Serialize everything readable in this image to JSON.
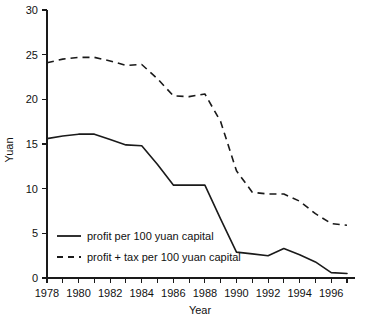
{
  "chart_data": {
    "type": "line",
    "title": "",
    "xlabel": "Year",
    "ylabel": "Yuan",
    "xlim": [
      1978,
      1997
    ],
    "ylim": [
      0,
      30
    ],
    "yticks": [
      0,
      5,
      10,
      15,
      20,
      25,
      30
    ],
    "ytick_labels": [
      "0",
      "5",
      "10",
      "15",
      "20",
      "25",
      "30"
    ],
    "xticks": [
      1978,
      1980,
      1982,
      1984,
      1986,
      1988,
      1990,
      1992,
      1994,
      1996
    ],
    "xtick_labels": [
      "1978",
      "1980",
      "1982",
      "1984",
      "1986",
      "1988",
      "1990",
      "1992",
      "1994",
      "1996"
    ],
    "x": [
      1978,
      1979,
      1980,
      1981,
      1982,
      1983,
      1984,
      1985,
      1986,
      1987,
      1988,
      1989,
      1990,
      1991,
      1992,
      1993,
      1994,
      1995,
      1996,
      1997
    ],
    "grid": false,
    "legend_position": "lower-left",
    "series": [
      {
        "name": "profit per 100 yuan capital",
        "style": "solid",
        "color": "#1a1a1a",
        "values": [
          15.6,
          15.9,
          16.1,
          16.1,
          15.5,
          14.9,
          14.8,
          12.7,
          10.4,
          10.4,
          10.4,
          6.6,
          2.9,
          2.7,
          2.5,
          3.3,
          2.6,
          1.8,
          0.6,
          0.5
        ]
      },
      {
        "name": "profit + tax per 100 yuan capital",
        "style": "dashed",
        "color": "#1a1a1a",
        "values": [
          24.1,
          24.5,
          24.7,
          24.7,
          24.3,
          23.8,
          23.9,
          22.3,
          20.4,
          20.3,
          20.6,
          17.5,
          12.0,
          9.6,
          9.4,
          9.4,
          8.6,
          7.2,
          6.1,
          5.9
        ]
      }
    ]
  },
  "axes": {
    "y_title": "Yuan",
    "x_title": "Year"
  },
  "legend": {
    "entries": [
      {
        "label": "profit per 100 yuan capital",
        "style": "solid"
      },
      {
        "label": "profit + tax per 100 yuan capital",
        "style": "dashed"
      }
    ]
  }
}
